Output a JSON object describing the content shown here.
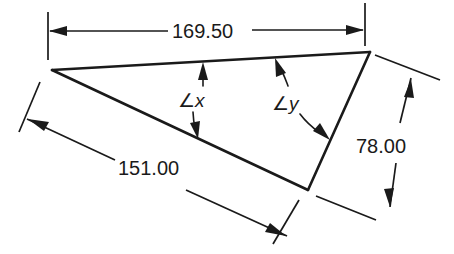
{
  "figure": {
    "type": "geometry-diagram",
    "background_color": "#ffffff",
    "line_color": "#1a1a1a"
  },
  "dimensions": {
    "top": {
      "name": "top-side-length",
      "value": "169.50",
      "orientation": "horizontal",
      "position": "above-triangle"
    },
    "lower_left": {
      "name": "long-side-length",
      "value": "151.00",
      "orientation": "diagonal",
      "position": "below-left-side"
    },
    "right": {
      "name": "right-side-length",
      "value": "78.00",
      "orientation": "diagonal",
      "position": "right-of-triangle"
    }
  },
  "angles": {
    "x": {
      "name": "angle-x",
      "symbol": "∠",
      "variable": "x",
      "label": "∠x"
    },
    "y": {
      "name": "angle-y",
      "symbol": "∠",
      "variable": "y",
      "label": "∠y"
    }
  },
  "vertices": {
    "left": {
      "x": 52,
      "y": 70
    },
    "top_right": {
      "x": 370,
      "y": 52
    },
    "bottom": {
      "x": 308,
      "y": 190
    }
  }
}
